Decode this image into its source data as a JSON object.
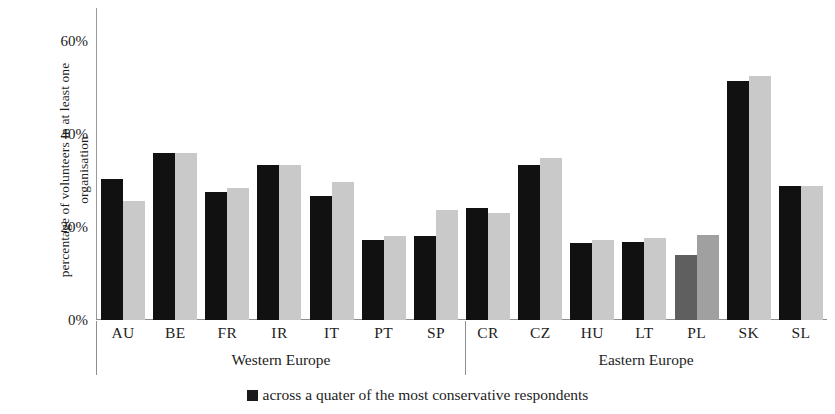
{
  "chart_data": {
    "type": "bar",
    "title": "",
    "xlabel": "",
    "ylabel": "percentage of volunteers  in at least one\norganisation",
    "ylim": [
      0,
      67
    ],
    "ytick_labels": [
      "60%",
      "40%",
      "20%",
      "0%"
    ],
    "ytick_values": [
      60,
      40,
      20,
      0
    ],
    "grid": false,
    "legend_position": "bottom-center",
    "categories": [
      "AU",
      "BE",
      "FR",
      "IR",
      "IT",
      "PT",
      "SP",
      "CR",
      "CZ",
      "HU",
      "LT",
      "PL",
      "SK",
      "SL"
    ],
    "groups": [
      {
        "name": "Western Europe",
        "categories": [
          "AU",
          "BE",
          "FR",
          "IR",
          "IT",
          "PT",
          "SP"
        ]
      },
      {
        "name": "Eastern Europe",
        "categories": [
          "CR",
          "CZ",
          "HU",
          "LT",
          "PL",
          "SK",
          "SL"
        ]
      }
    ],
    "series": [
      {
        "name": "across a quater of the most conservative respondents",
        "color": "#111111",
        "values": [
          30.3,
          35.9,
          27.5,
          33.3,
          26.7,
          17.2,
          18.1,
          24.1,
          33.3,
          16.6,
          16.8,
          14.0,
          51.4,
          28.8
        ]
      },
      {
        "name": "second series",
        "color": "#c9c9c9",
        "values": [
          25.6,
          35.9,
          28.4,
          33.3,
          29.7,
          18.1,
          23.7,
          23.0,
          34.8,
          17.2,
          17.6,
          18.3,
          52.5,
          28.8
        ]
      }
    ],
    "legend": [
      {
        "label": "across a quater of the most conservative respondents",
        "color": "#111111"
      }
    ]
  },
  "axis": {
    "y_title_line1": "percentage of volunteers  in at least one",
    "y_title_line2": "organisation",
    "ticks": [
      {
        "label": "60%",
        "value": 60
      },
      {
        "label": "40%",
        "value": 40
      },
      {
        "label": "20%",
        "value": 20
      },
      {
        "label": "0%",
        "value": 0
      }
    ]
  },
  "regions": {
    "west": "Western Europe",
    "east": "Eastern Europe"
  },
  "legend": {
    "entry_label": "across a quater of the most conservative respondents"
  },
  "colors": {
    "dark_series": "#111111",
    "light_series": "#c9c9c9",
    "axis": "#8e8e8e",
    "text": "#1d1d1d",
    "background": "#ffffff"
  }
}
